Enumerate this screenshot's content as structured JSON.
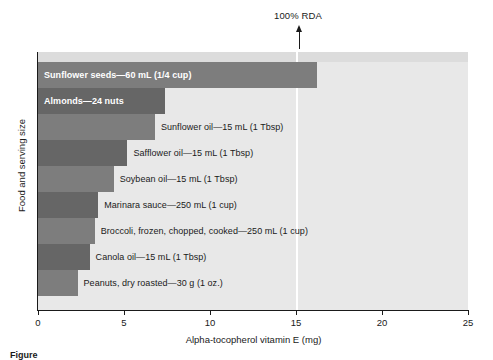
{
  "chart_data": {
    "type": "bar",
    "orientation": "horizontal",
    "title": "",
    "xlabel": "Alpha-tocopherol vitamin E (mg)",
    "ylabel": "Food and serving size",
    "xlim": [
      0,
      25
    ],
    "xticks": [
      0,
      5,
      10,
      15,
      20,
      25
    ],
    "xtick_labels": [
      "0",
      "5",
      "10",
      "15",
      "20",
      "25"
    ],
    "grid": false,
    "legend": "none",
    "categories": [
      "Sunflower seeds—60 mL (1/4 cup)",
      "Almonds—24 nuts",
      "Sunflower oil—15 mL (1 Tbsp)",
      "Safflower oil—15 mL (1 Tbsp)",
      "Soybean oil—15 mL (1 Tbsp)",
      "Marinara sauce—250 mL (1 cup)",
      "Broccoli, frozen, chopped, cooked—250 mL (1 cup)",
      "Canola oil—15 mL (1 Tbsp)",
      "Peanuts, dry roasted—30 g (1 oz.)"
    ],
    "values": [
      16.2,
      7.4,
      6.8,
      5.2,
      4.4,
      3.5,
      3.3,
      3.0,
      2.3
    ],
    "annotations": [
      {
        "label": "100% RDA",
        "x": 15,
        "type": "vertical-line-with-arrow"
      }
    ]
  },
  "bars": [
    {
      "label": "Sunflower seeds—60 mL (1/4 cup)",
      "value": 16.2,
      "color": "#7d7d7d",
      "label_position": "inside"
    },
    {
      "label": "Almonds—24 nuts",
      "value": 7.4,
      "color": "#666666",
      "label_position": "inside"
    },
    {
      "label": "Sunflower oil—15 mL (1 Tbsp)",
      "value": 6.8,
      "color": "#7d7d7d",
      "label_position": "outside"
    },
    {
      "label": "Safflower oil—15 mL (1 Tbsp)",
      "value": 5.2,
      "color": "#666666",
      "label_position": "outside"
    },
    {
      "label": "Soybean oil—15 mL (1 Tbsp)",
      "value": 4.4,
      "color": "#7d7d7d",
      "label_position": "outside"
    },
    {
      "label": "Marinara sauce—250 mL (1 cup)",
      "value": 3.5,
      "color": "#666666",
      "label_position": "outside"
    },
    {
      "label": "Broccoli, frozen, chopped, cooked—250 mL (1 cup)",
      "value": 3.3,
      "color": "#7d7d7d",
      "label_position": "outside"
    },
    {
      "label": "Canola oil—15 mL (1 Tbsp)",
      "value": 3.0,
      "color": "#666666",
      "label_position": "outside"
    },
    {
      "label": "Peanuts, dry roasted—30 g (1 oz.)",
      "value": 2.3,
      "color": "#7d7d7d",
      "label_position": "outside"
    }
  ],
  "rda": {
    "label": "100% RDA",
    "value": 15
  },
  "axes": {
    "x_title": "Alpha-tocopherol vitamin E (mg)",
    "y_title": "Food and serving size",
    "x_ticks": [
      "0",
      "5",
      "10",
      "15",
      "20",
      "25"
    ]
  },
  "caption": {
    "text": "Figure"
  },
  "colors": {
    "plot_background": "#e8e8e8",
    "plot_top_band": "#dcdcdc",
    "bar_light": "#7d7d7d",
    "bar_dark": "#666666",
    "axis": "#1a1a1a",
    "rda_line": "#ffffff"
  }
}
